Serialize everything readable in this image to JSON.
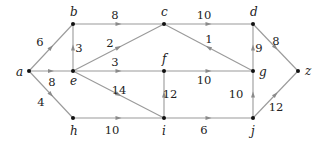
{
  "diagram": {
    "type": "weighted-directed-graph",
    "nodes": [
      {
        "id": "a",
        "x": 29,
        "y": 71,
        "lx": -13,
        "ly": 5
      },
      {
        "id": "b",
        "x": 73,
        "y": 24,
        "lx": -3,
        "ly": -8
      },
      {
        "id": "c",
        "x": 164,
        "y": 24,
        "lx": -3,
        "ly": -8
      },
      {
        "id": "d",
        "x": 253,
        "y": 24,
        "lx": -3,
        "ly": -8
      },
      {
        "id": "e",
        "x": 73,
        "y": 71,
        "lx": -3,
        "ly": 14
      },
      {
        "id": "f",
        "x": 164,
        "y": 71,
        "lx": -2,
        "ly": -8
      },
      {
        "id": "g",
        "x": 253,
        "y": 71,
        "lx": 6,
        "ly": 5
      },
      {
        "id": "z",
        "x": 298,
        "y": 71,
        "lx": 7,
        "ly": 4
      },
      {
        "id": "h",
        "x": 73,
        "y": 118,
        "lx": -3,
        "ly": 17
      },
      {
        "id": "i",
        "x": 164,
        "y": 118,
        "lx": -2,
        "ly": 17
      },
      {
        "id": "j",
        "x": 253,
        "y": 118,
        "lx": -2,
        "ly": 17
      }
    ],
    "edges": [
      {
        "from": "a",
        "to": "b",
        "weight": "6",
        "wx": 40,
        "wy": 46
      },
      {
        "from": "a",
        "to": "e",
        "weight": "8",
        "wx": 52,
        "wy": 86
      },
      {
        "from": "a",
        "to": "h",
        "weight": "4",
        "wx": 41,
        "wy": 106
      },
      {
        "from": "b",
        "to": "c",
        "weight": "8",
        "wx": 115,
        "wy": 19
      },
      {
        "from": "e",
        "to": "b",
        "weight": "3",
        "wx": 79,
        "wy": 52
      },
      {
        "from": "e",
        "to": "c",
        "weight": "2",
        "wx": 110,
        "wy": 47
      },
      {
        "from": "e",
        "to": "f",
        "weight": "3",
        "wx": 115,
        "wy": 66
      },
      {
        "from": "e",
        "to": "i",
        "weight": "14",
        "wx": 119,
        "wy": 94
      },
      {
        "from": "c",
        "to": "d",
        "weight": "10",
        "wx": 204,
        "wy": 19
      },
      {
        "from": "g",
        "to": "c",
        "weight": "1",
        "wx": 209,
        "wy": 43
      },
      {
        "from": "f",
        "to": "g",
        "weight": "10",
        "wx": 204,
        "wy": 84
      },
      {
        "from": "g",
        "to": "d",
        "weight": "9",
        "wx": 259,
        "wy": 52
      },
      {
        "from": "d",
        "to": "z",
        "weight": "8",
        "wx": 276,
        "wy": 45
      },
      {
        "from": "i",
        "to": "f",
        "weight": "12",
        "wx": 170,
        "wy": 98
      },
      {
        "from": "h",
        "to": "i",
        "weight": "10",
        "wx": 112,
        "wy": 134
      },
      {
        "from": "i",
        "to": "j",
        "weight": "6",
        "wx": 204,
        "wy": 134
      },
      {
        "from": "j",
        "to": "g",
        "weight": "10",
        "wx": 236,
        "wy": 98
      },
      {
        "from": "j",
        "to": "z",
        "weight": "12",
        "wx": 276,
        "wy": 111
      }
    ]
  }
}
